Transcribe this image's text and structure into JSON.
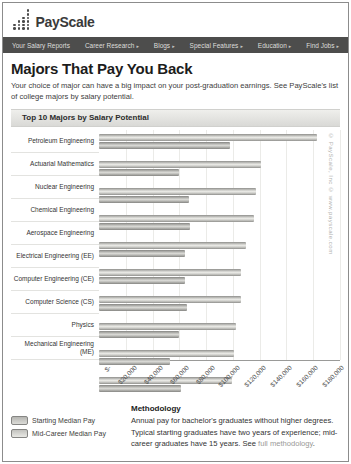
{
  "header": {
    "logo_text": "PayScale"
  },
  "nav": {
    "items": [
      {
        "label": "Your Salary Reports",
        "arrow": false
      },
      {
        "label": "Career Research",
        "arrow": true
      },
      {
        "label": "Blogs",
        "arrow": true
      },
      {
        "label": "Special Features",
        "arrow": true
      },
      {
        "label": "Education",
        "arrow": true
      },
      {
        "label": "Find Jobs",
        "arrow": true
      }
    ]
  },
  "page": {
    "title": "Majors That Pay You Back",
    "intro": "Your choice of major can have a big impact on your post-graduation earnings. See PayScale's list of college majors by salary potential.",
    "section_header": "Top 10 Majors by Salary Potential"
  },
  "chart_data": {
    "type": "bar",
    "orientation": "horizontal",
    "title": "Top 10 Majors by Salary Potential",
    "categories": [
      "Petroleum Engineering",
      "Actuarial Mathematics",
      "Nuclear Engineering",
      "Chemical Engineering",
      "Aerospace Engineering",
      "Electrical Engineering (EE)",
      "Computer Engineering (CE)",
      "Computer Science (CS)",
      "Physics",
      "Mechanical Engineering (ME)"
    ],
    "series": [
      {
        "name": "Starting Median Pay",
        "values": [
          98000,
          60000,
          67000,
          68000,
          64000,
          64000,
          66000,
          60000,
          53000,
          61000
        ]
      },
      {
        "name": "Mid-Career Median Pay",
        "values": [
          163000,
          121000,
          117000,
          116000,
          110000,
          106000,
          106000,
          102000,
          101000,
          99000
        ]
      }
    ],
    "xlim": [
      0,
      180000
    ],
    "x_tick_labels": [
      "$-",
      "$20,000",
      "$40,000",
      "$60,000",
      "$80,000",
      "$100,000",
      "$120,000",
      "$140,000",
      "$160,000",
      "$180,000"
    ],
    "grid": true,
    "legend_position": "bottom-left",
    "note": "mid-career bar drawn above starting bar in each pair"
  },
  "watermark": {
    "text": "© PayScale, Inc © www.payscale.com"
  },
  "footer": {
    "methodology_title": "Methodology",
    "methodology_text": "Annual pay for bachelor's graduates without higher degrees. Typical starting graduates have two years of experience; mid-career graduates have 15 years. See ",
    "methodology_link": "full methodology",
    "methodology_period": "."
  }
}
